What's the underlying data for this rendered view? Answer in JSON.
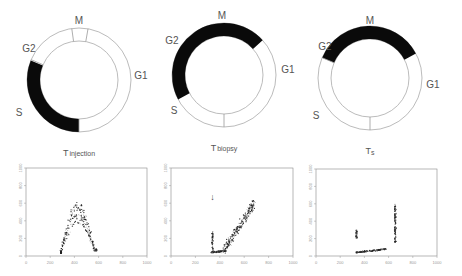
{
  "panels": [
    {
      "title": "T injection",
      "title_main": "T",
      "title_sub": "injection",
      "cycle": {
        "labels": {
          "M": "M",
          "G2": "G2",
          "G1": "G1",
          "S": "S"
        },
        "highlight_phase": "S",
        "highlight_start_deg": 180,
        "highlight_end_deg": 292,
        "tick_marks_deg": [
          352,
          10,
          293,
          180
        ]
      },
      "scatter": {
        "clusters": [
          {
            "name": "G1-peak",
            "x": 290,
            "y": 40,
            "spread_x": 8,
            "spread_y": 15,
            "count": 40,
            "dense": true
          },
          {
            "name": "G2-peak",
            "x": 580,
            "y": 70,
            "spread_x": 8,
            "spread_y": 12,
            "count": 30,
            "dense": true
          },
          {
            "name": "S-arc",
            "type": "arc",
            "x0": 290,
            "x1": 580,
            "ymax": 560,
            "count": 260
          }
        ]
      }
    },
    {
      "title": "T biopsy",
      "title_main": "T",
      "title_sub": "biopsy",
      "cycle": {
        "labels": {
          "M": "M",
          "G2": "G2",
          "G1": "G1",
          "S": "S"
        },
        "highlight_phase": "G2/M",
        "highlight_start_deg": 242,
        "highlight_end_deg": 48,
        "tick_marks_deg": [
          180
        ]
      },
      "scatter": {
        "annotation": "↓",
        "clusters": [
          {
            "name": "G1-base",
            "type": "line",
            "x0": 330,
            "x1": 450,
            "y0": 40,
            "y1": 60,
            "count": 140
          },
          {
            "name": "vertical-column",
            "type": "vline",
            "x": 340,
            "y0": 60,
            "y1": 280,
            "count": 60
          },
          {
            "name": "rising-diagonal",
            "type": "diag",
            "x0": 430,
            "y0": 60,
            "x1": 690,
            "y1": 620,
            "count": 260
          }
        ]
      }
    },
    {
      "title": "Ts",
      "title_main": "T",
      "title_sub": "s",
      "cycle": {
        "labels": {
          "M": "M",
          "G2": "G2",
          "G1": "G1",
          "S": "S"
        },
        "highlight_phase": "G2/M",
        "highlight_start_deg": 293,
        "highlight_end_deg": 62,
        "tick_marks_deg": [
          180,
          293
        ]
      },
      "scatter": {
        "clusters": [
          {
            "name": "base-line",
            "type": "line",
            "x0": 330,
            "x1": 580,
            "y0": 40,
            "y1": 80,
            "count": 170
          },
          {
            "name": "left-column",
            "type": "vline",
            "x": 335,
            "y0": 200,
            "y1": 300,
            "count": 50
          },
          {
            "name": "right-column",
            "type": "vline",
            "x": 655,
            "y0": 150,
            "y1": 600,
            "count": 150
          }
        ]
      }
    }
  ],
  "axes": {
    "x_ticks": [
      "0",
      "200",
      "400",
      "600",
      "800",
      "1000"
    ],
    "y_ticks": [
      "0",
      "200",
      "400",
      "600",
      "800",
      "1000"
    ],
    "x_range": [
      0,
      1000
    ],
    "y_range": [
      0,
      1000
    ]
  }
}
